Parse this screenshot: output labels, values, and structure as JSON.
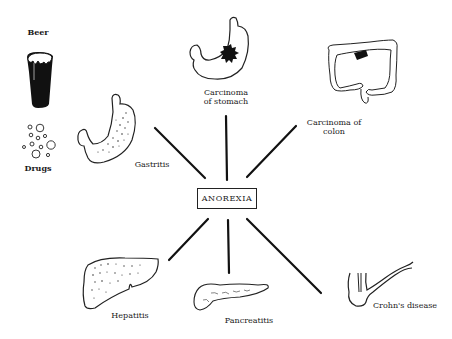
{
  "diagram": {
    "center": {
      "label": "ANOREXIA"
    },
    "causes": [
      {
        "id": "beer",
        "label": "Beer"
      },
      {
        "id": "drugs",
        "label": "Drugs"
      },
      {
        "id": "gastritis",
        "label": "Gastritis"
      },
      {
        "id": "carcinoma-stomach",
        "label_line1": "Carcinoma",
        "label_line2": "of stomach"
      },
      {
        "id": "carcinoma-colon",
        "label_line1": "Carcinoma of",
        "label_line2": "colon"
      },
      {
        "id": "hepatitis",
        "label": "Hepatitis"
      },
      {
        "id": "pancreatitis",
        "label": "Pancreatitis"
      },
      {
        "id": "crohns",
        "label": "Crohn's disease"
      }
    ],
    "connectors": [
      {
        "to": "gastritis",
        "x1": 155,
        "y1": 128,
        "x2": 205,
        "y2": 178
      },
      {
        "to": "carcinoma-stomach",
        "x1": 226,
        "y1": 116,
        "x2": 227,
        "y2": 180
      },
      {
        "to": "carcinoma-colon",
        "x1": 296,
        "y1": 126,
        "x2": 247,
        "y2": 177
      },
      {
        "to": "hepatitis",
        "x1": 208,
        "y1": 219,
        "x2": 169,
        "y2": 260
      },
      {
        "to": "pancreatitis",
        "x1": 228,
        "y1": 220,
        "x2": 229,
        "y2": 273
      },
      {
        "to": "crohns",
        "x1": 247,
        "y1": 219,
        "x2": 321,
        "y2": 293
      }
    ]
  }
}
